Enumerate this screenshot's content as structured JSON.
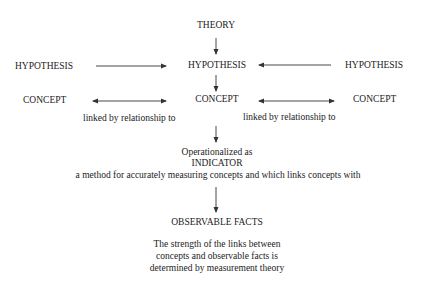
{
  "diagram": {
    "theory": "THEORY",
    "hypotheses": [
      "HYPOTHESIS",
      "HYPOTHESIS",
      "HYPOTHESIS"
    ],
    "concepts": [
      "CONCEPT",
      "CONCEPT",
      "CONCEPT"
    ],
    "link_labels": [
      "linked by relationship to",
      "linked by relationship to"
    ],
    "operationalized": "Operationalized as",
    "indicator": "INDICATOR",
    "indicator_desc": "a method for accurately measuring concepts and which links concepts with",
    "observable_facts": "OBSERVABLE FACTS",
    "note_lines": [
      "The strength of the links between",
      "concepts and observable facts is",
      "determined by measurement theory"
    ]
  },
  "colors": {
    "text": "#222222",
    "line": "#333333",
    "background": "#ffffff"
  }
}
